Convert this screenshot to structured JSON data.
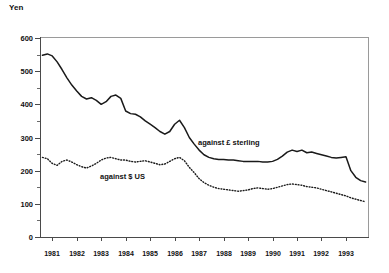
{
  "chart_data": {
    "type": "line",
    "title": "",
    "xlabel": "",
    "ylabel": "Yen",
    "ylim": [
      0,
      600
    ],
    "xlim": [
      1980.5,
      1993.9
    ],
    "grid": false,
    "legend_position": "inline-annotations",
    "ytick_labels": [
      "600",
      "500",
      "400",
      "300",
      "200",
      "100",
      "0"
    ],
    "ytick_values": [
      600,
      500,
      400,
      300,
      200,
      100,
      0
    ],
    "ytick_minor_values": [
      550,
      450,
      350,
      250,
      150,
      50
    ],
    "categories": [
      "1981",
      "1982",
      "1983",
      "1984",
      "1985",
      "1986",
      "1987",
      "1988",
      "1989",
      "1990",
      "1991",
      "1992",
      "1993"
    ],
    "annotations": [
      {
        "text": "against £ sterling",
        "near_year": 1988.2,
        "near_value": 255
      },
      {
        "text": "against $ US",
        "near_year": 1984.3,
        "near_value": 175
      }
    ],
    "series": [
      {
        "name": "against £ sterling",
        "style": "solid",
        "x": [
          1980.6,
          1980.8,
          1981.0,
          1981.2,
          1981.4,
          1981.6,
          1981.8,
          1982.0,
          1982.2,
          1982.4,
          1982.6,
          1982.8,
          1983.0,
          1983.2,
          1983.4,
          1983.6,
          1983.8,
          1984.0,
          1984.2,
          1984.4,
          1984.6,
          1984.8,
          1985.0,
          1985.2,
          1985.4,
          1985.6,
          1985.8,
          1986.0,
          1986.2,
          1986.4,
          1986.6,
          1986.8,
          1987.0,
          1987.2,
          1987.4,
          1987.6,
          1987.8,
          1988.0,
          1988.2,
          1988.4,
          1988.6,
          1988.8,
          1989.0,
          1989.2,
          1989.4,
          1989.6,
          1989.8,
          1990.0,
          1990.2,
          1990.4,
          1990.6,
          1990.8,
          1991.0,
          1991.2,
          1991.4,
          1991.6,
          1991.8,
          1992.0,
          1992.2,
          1992.4,
          1992.6,
          1992.8,
          1993.0,
          1993.2,
          1993.4,
          1993.6,
          1993.8
        ],
        "values": [
          548,
          552,
          546,
          528,
          505,
          480,
          458,
          440,
          424,
          416,
          420,
          412,
          400,
          408,
          424,
          428,
          418,
          380,
          372,
          370,
          362,
          350,
          340,
          330,
          318,
          310,
          318,
          340,
          352,
          330,
          300,
          280,
          262,
          248,
          240,
          236,
          234,
          234,
          232,
          232,
          230,
          228,
          228,
          228,
          228,
          226,
          226,
          228,
          234,
          244,
          256,
          262,
          258,
          262,
          254,
          256,
          252,
          248,
          244,
          240,
          238,
          240,
          242,
          200,
          180,
          170,
          166
        ],
        "unit": "Yen per £"
      },
      {
        "name": "against $ US",
        "style": "dotted",
        "x": [
          1980.6,
          1980.8,
          1981.0,
          1981.2,
          1981.4,
          1981.6,
          1981.8,
          1982.0,
          1982.2,
          1982.4,
          1982.6,
          1982.8,
          1983.0,
          1983.2,
          1983.4,
          1983.6,
          1983.8,
          1984.0,
          1984.2,
          1984.4,
          1984.6,
          1984.8,
          1985.0,
          1985.2,
          1985.4,
          1985.6,
          1985.8,
          1986.0,
          1986.2,
          1986.4,
          1986.6,
          1986.8,
          1987.0,
          1987.2,
          1987.4,
          1987.6,
          1987.8,
          1988.0,
          1988.2,
          1988.4,
          1988.6,
          1988.8,
          1989.0,
          1989.2,
          1989.4,
          1989.6,
          1989.8,
          1990.0,
          1990.2,
          1990.4,
          1990.6,
          1990.8,
          1991.0,
          1991.2,
          1991.4,
          1991.6,
          1991.8,
          1992.0,
          1992.2,
          1992.4,
          1992.6,
          1992.8,
          1993.0,
          1993.2,
          1993.4,
          1993.6,
          1993.8
        ],
        "values": [
          240,
          236,
          222,
          216,
          228,
          232,
          226,
          218,
          212,
          208,
          214,
          222,
          232,
          238,
          240,
          236,
          232,
          232,
          228,
          226,
          228,
          230,
          226,
          222,
          218,
          220,
          228,
          236,
          240,
          230,
          210,
          194,
          176,
          164,
          156,
          150,
          146,
          144,
          142,
          140,
          138,
          140,
          142,
          146,
          148,
          146,
          144,
          146,
          150,
          154,
          158,
          160,
          158,
          156,
          152,
          150,
          148,
          144,
          140,
          136,
          132,
          128,
          124,
          118,
          114,
          110,
          106
        ],
        "unit": "Yen per $"
      }
    ]
  },
  "axis": {
    "y_title": "Yen"
  }
}
